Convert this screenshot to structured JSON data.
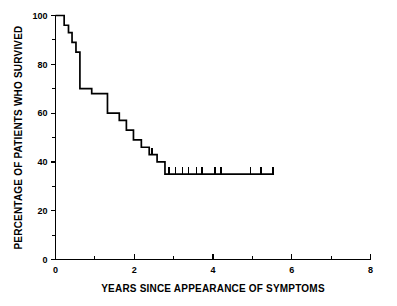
{
  "chart_data": {
    "type": "line",
    "title": "",
    "subtitle": "",
    "xlabel": "YEARS SINCE APPEARANCE OF SYMPTOMS",
    "ylabel": "PERCENTAGE OF PATIENTS WHO SURVIVED",
    "xlim": [
      0,
      8
    ],
    "ylim": [
      0,
      100
    ],
    "xticks": [
      0,
      2,
      4,
      6,
      8
    ],
    "xtick_labels": [
      "0",
      "2",
      "4",
      "6",
      "8"
    ],
    "xticks_minor": [
      1,
      3,
      5,
      7
    ],
    "yticks": [
      0,
      20,
      40,
      60,
      80,
      100
    ],
    "ytick_labels": [
      "0",
      "20",
      "40",
      "60",
      "80",
      "100"
    ],
    "yticks_minor": [
      10,
      30,
      50,
      70,
      90
    ],
    "grid": false,
    "legend": false,
    "legend_position": "none",
    "curve_style": "step",
    "series": [
      {
        "name": "Survival",
        "step_points": [
          [
            0.0,
            100
          ],
          [
            0.22,
            100
          ],
          [
            0.22,
            96
          ],
          [
            0.33,
            96
          ],
          [
            0.33,
            93
          ],
          [
            0.42,
            93
          ],
          [
            0.42,
            89
          ],
          [
            0.52,
            89
          ],
          [
            0.52,
            85
          ],
          [
            0.62,
            85
          ],
          [
            0.62,
            70
          ],
          [
            0.92,
            70
          ],
          [
            0.92,
            68
          ],
          [
            1.32,
            68
          ],
          [
            1.32,
            60
          ],
          [
            1.62,
            60
          ],
          [
            1.62,
            57
          ],
          [
            1.8,
            57
          ],
          [
            1.8,
            53
          ],
          [
            1.98,
            53
          ],
          [
            1.98,
            49
          ],
          [
            2.18,
            49
          ],
          [
            2.18,
            46
          ],
          [
            2.38,
            46
          ],
          [
            2.38,
            43
          ],
          [
            2.58,
            43
          ],
          [
            2.58,
            40
          ],
          [
            2.78,
            40
          ],
          [
            2.78,
            35
          ],
          [
            5.55,
            35
          ]
        ]
      }
    ],
    "censoring_marks": [
      {
        "x": 2.45,
        "y": 43
      },
      {
        "x": 2.88,
        "y": 35
      },
      {
        "x": 3.05,
        "y": 35
      },
      {
        "x": 3.22,
        "y": 35
      },
      {
        "x": 3.38,
        "y": 35
      },
      {
        "x": 3.58,
        "y": 35
      },
      {
        "x": 3.72,
        "y": 35
      },
      {
        "x": 4.05,
        "y": 35
      },
      {
        "x": 4.2,
        "y": 35
      },
      {
        "x": 4.95,
        "y": 35
      },
      {
        "x": 5.22,
        "y": 35
      },
      {
        "x": 5.52,
        "y": 35
      }
    ],
    "annotations": []
  }
}
